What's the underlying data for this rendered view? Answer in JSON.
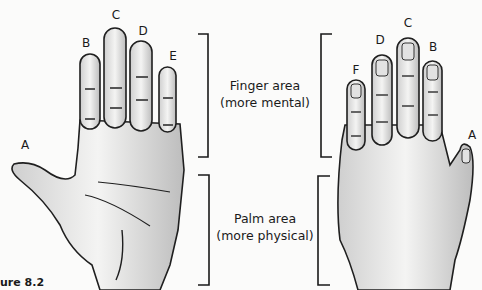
{
  "figure": {
    "label": "ure 8.2",
    "left_hand": {
      "view": "palm",
      "labels": [
        {
          "id": "A",
          "text": "A",
          "x": 25,
          "y": 145
        },
        {
          "id": "B",
          "text": "B",
          "x": 86,
          "y": 43
        },
        {
          "id": "C",
          "text": "C",
          "x": 116,
          "y": 15
        },
        {
          "id": "D",
          "text": "D",
          "x": 143,
          "y": 31
        },
        {
          "id": "E",
          "text": "E",
          "x": 173,
          "y": 56
        }
      ]
    },
    "right_hand": {
      "view": "back",
      "labels": [
        {
          "id": "F",
          "text": "F",
          "x": 356,
          "y": 70
        },
        {
          "id": "D",
          "text": "D",
          "x": 380,
          "y": 40
        },
        {
          "id": "C",
          "text": "C",
          "x": 408,
          "y": 23
        },
        {
          "id": "B",
          "text": "B",
          "x": 433,
          "y": 47
        },
        {
          "id": "A",
          "text": "A",
          "x": 472,
          "y": 135
        }
      ]
    },
    "regions": {
      "finger": {
        "title": "Finger area",
        "subtitle": "(more mental)"
      },
      "palm": {
        "title": "Palm area",
        "subtitle": "(more physical)"
      }
    },
    "colors": {
      "ink": "#1a1a1a",
      "paper": "#fbfbfa",
      "shade": "#8a8a8a"
    }
  }
}
